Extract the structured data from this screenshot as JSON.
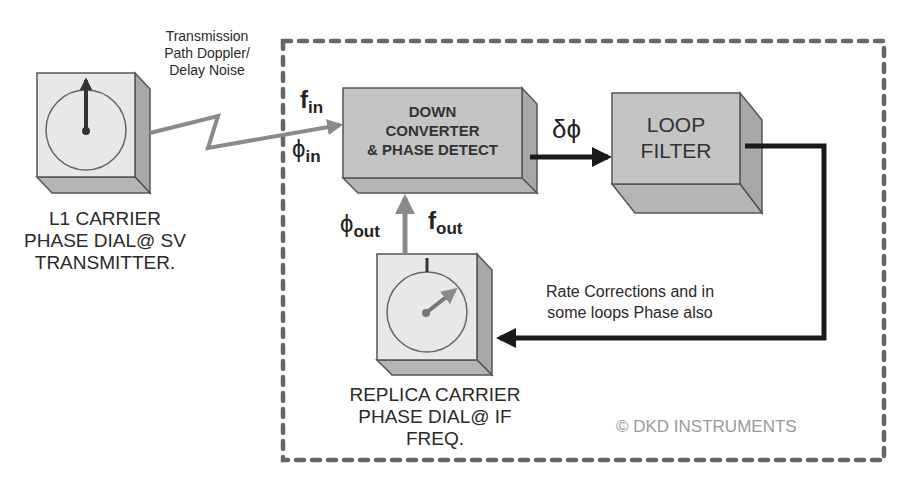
{
  "diagram": {
    "colors": {
      "box_front": "#c4c4c4",
      "box_side": "#a8a8a8",
      "box_bottom": "#b5b5b5",
      "dial_face": "#e8e8e8",
      "signal_gray": "#8a8a8a",
      "loop_black": "#1a1a1a",
      "dashed_border": "#666666",
      "copyright": "#9a9a9a"
    },
    "transmitter": {
      "caption_line1": "L1 CARRIER",
      "caption_line2": "PHASE DIAL@ SV",
      "caption_line3": "TRANSMITTER."
    },
    "noise_label": {
      "line1": "Transmission",
      "line2": "Path Doppler/",
      "line3": "Delay Noise"
    },
    "inputs": {
      "f_symbol": "f",
      "f_sub": "in",
      "phi_symbol": "ϕ",
      "phi_sub": "in"
    },
    "down_converter": {
      "line1": "DOWN",
      "line2": "CONVERTER",
      "line3": "& PHASE DETECT"
    },
    "error_signal": {
      "label": "δϕ"
    },
    "loop_filter": {
      "line1": "LOOP",
      "line2": "FILTER"
    },
    "feedback": {
      "line1": "Rate Corrections and in",
      "line2": "some loops Phase also"
    },
    "outputs": {
      "phi_symbol": "ϕ",
      "phi_sub": "out",
      "f_symbol": "f",
      "f_sub": "out"
    },
    "replica": {
      "caption_line1": "REPLICA CARRIER",
      "caption_line2": "PHASE DIAL@ IF FREQ."
    },
    "copyright": "© DKD INSTRUMENTS"
  }
}
